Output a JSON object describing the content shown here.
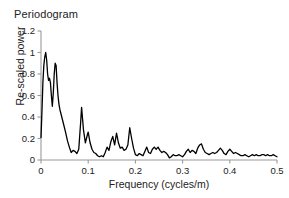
{
  "chart_data": {
    "type": "line",
    "title": "Periodogram",
    "xlabel": "Frequency (cycles/m)",
    "ylabel": "Re-scaled power",
    "xlim": [
      0,
      0.5
    ],
    "ylim": [
      0,
      1.2
    ],
    "xticks": [
      "0",
      "0.1",
      "0.2",
      "0.3",
      "0.4",
      "0.5"
    ],
    "xtick_values": [
      0,
      0.1,
      0.2,
      0.3,
      0.4,
      0.5
    ],
    "yticks": [
      "0",
      "0.2",
      "0.4",
      "0.6",
      "0.8",
      "1",
      "1.2"
    ],
    "ytick_values": [
      0,
      0.2,
      0.4,
      0.6,
      0.8,
      1,
      1.2
    ],
    "grid": false,
    "legend": "none",
    "line_color": "#000000",
    "line_width": 1.3,
    "series": [
      {
        "name": "Re-scaled power",
        "x": [
          0.0,
          0.002,
          0.004,
          0.006,
          0.008,
          0.01,
          0.012,
          0.014,
          0.016,
          0.018,
          0.02,
          0.022,
          0.024,
          0.026,
          0.028,
          0.03,
          0.032,
          0.034,
          0.036,
          0.038,
          0.04,
          0.044,
          0.048,
          0.052,
          0.056,
          0.06,
          0.064,
          0.068,
          0.072,
          0.076,
          0.08,
          0.084,
          0.086,
          0.09,
          0.094,
          0.098,
          0.1,
          0.104,
          0.108,
          0.112,
          0.116,
          0.12,
          0.124,
          0.128,
          0.132,
          0.136,
          0.14,
          0.144,
          0.148,
          0.152,
          0.156,
          0.16,
          0.164,
          0.168,
          0.172,
          0.176,
          0.18,
          0.184,
          0.188,
          0.192,
          0.196,
          0.2,
          0.204,
          0.208,
          0.212,
          0.216,
          0.22,
          0.224,
          0.228,
          0.232,
          0.236,
          0.24,
          0.244,
          0.248,
          0.252,
          0.256,
          0.26,
          0.264,
          0.268,
          0.272,
          0.276,
          0.28,
          0.284,
          0.288,
          0.292,
          0.296,
          0.3,
          0.304,
          0.308,
          0.312,
          0.316,
          0.32,
          0.324,
          0.328,
          0.332,
          0.336,
          0.34,
          0.344,
          0.348,
          0.352,
          0.356,
          0.36,
          0.364,
          0.368,
          0.372,
          0.376,
          0.38,
          0.384,
          0.388,
          0.392,
          0.396,
          0.4,
          0.404,
          0.408,
          0.412,
          0.416,
          0.42,
          0.424,
          0.428,
          0.432,
          0.436,
          0.44,
          0.444,
          0.448,
          0.452,
          0.456,
          0.46,
          0.464,
          0.468,
          0.472,
          0.476,
          0.48,
          0.484,
          0.488,
          0.492,
          0.496,
          0.5
        ],
        "values": [
          0.21,
          0.45,
          0.72,
          0.88,
          0.96,
          1.0,
          0.93,
          0.8,
          0.74,
          0.76,
          0.72,
          0.6,
          0.5,
          0.62,
          0.8,
          0.9,
          0.88,
          0.72,
          0.6,
          0.52,
          0.47,
          0.4,
          0.33,
          0.26,
          0.18,
          0.12,
          0.07,
          0.09,
          0.08,
          0.06,
          0.1,
          0.35,
          0.49,
          0.28,
          0.16,
          0.23,
          0.26,
          0.16,
          0.1,
          0.07,
          0.06,
          0.04,
          0.03,
          0.04,
          0.03,
          0.07,
          0.12,
          0.09,
          0.17,
          0.22,
          0.14,
          0.25,
          0.16,
          0.11,
          0.12,
          0.09,
          0.1,
          0.14,
          0.3,
          0.2,
          0.11,
          0.05,
          0.04,
          0.06,
          0.05,
          0.04,
          0.08,
          0.12,
          0.07,
          0.06,
          0.1,
          0.12,
          0.1,
          0.12,
          0.09,
          0.07,
          0.08,
          0.07,
          0.05,
          0.02,
          0.03,
          0.05,
          0.04,
          0.04,
          0.05,
          0.04,
          0.03,
          0.05,
          0.08,
          0.1,
          0.07,
          0.09,
          0.08,
          0.06,
          0.11,
          0.14,
          0.15,
          0.1,
          0.07,
          0.06,
          0.05,
          0.06,
          0.07,
          0.06,
          0.07,
          0.09,
          0.11,
          0.09,
          0.06,
          0.05,
          0.08,
          0.1,
          0.08,
          0.06,
          0.07,
          0.06,
          0.05,
          0.04,
          0.04,
          0.05,
          0.04,
          0.03,
          0.04,
          0.05,
          0.04,
          0.05,
          0.04,
          0.04,
          0.05,
          0.05,
          0.04,
          0.05,
          0.04,
          0.04,
          0.05,
          0.04,
          0.03
        ]
      }
    ]
  },
  "axis": {
    "color": "#9a9a9a",
    "tick_color": "#555555"
  }
}
